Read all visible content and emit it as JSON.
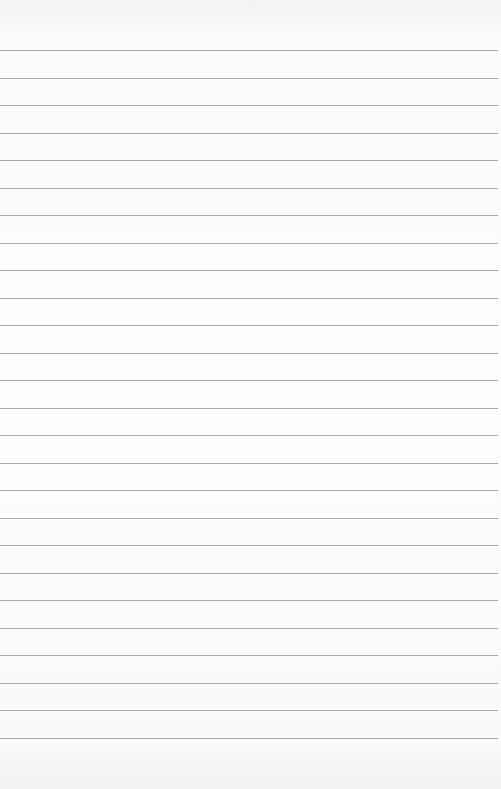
{
  "paper": {
    "type": "lined-paper",
    "line_count": 26,
    "first_line_y": 50,
    "line_spacing": 27.5,
    "line_color": "#9a9a9a",
    "background_color": "#fcfcfc"
  }
}
